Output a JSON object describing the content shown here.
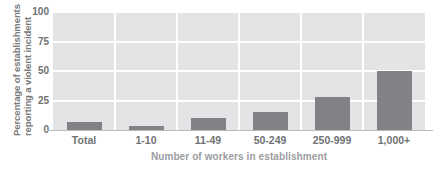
{
  "chart_data": {
    "type": "bar",
    "title": "",
    "subtitle": "",
    "xlabel": "Number of workers in establishment",
    "ylabel": "Percentage of establishments reporting a violent incident",
    "ylabel_line1": "Percentage of establishments",
    "ylabel_line2": "reporting a violent incident",
    "categories": [
      "Total",
      "1-10",
      "11-49",
      "50-249",
      "250-999",
      "1,000+"
    ],
    "values": [
      7,
      3,
      10,
      15,
      28,
      50
    ],
    "ylim": [
      0,
      100
    ],
    "yticks": [
      0,
      25,
      50,
      75,
      100
    ],
    "ytick_labels": [
      "0",
      "25",
      "50",
      "75",
      "100"
    ],
    "grid": true,
    "grid_axis": "both",
    "legend": false,
    "legend_position": "none",
    "colors": {
      "bar": "#808285",
      "plot_background": "#e3e4e5",
      "gridline": "#ffffff",
      "axis_text": "#6f7173",
      "axis_title": "#9b9d9f",
      "ylabel_text": "#77797b",
      "page_background": "#ffffff"
    }
  }
}
